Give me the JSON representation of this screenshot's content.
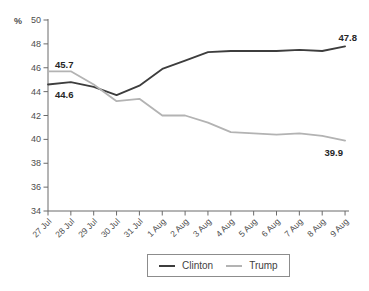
{
  "chart_data": {
    "type": "line",
    "title": "",
    "ylabel": "%",
    "categories": [
      "27 Jul",
      "28 Jul",
      "29 Jul",
      "30 Jul",
      "31 Jul",
      "1 Aug",
      "2 Aug",
      "3 Aug",
      "4 Aug",
      "5 Aug",
      "6 Aug",
      "7 Aug",
      "8 Aug",
      "9 Aug"
    ],
    "series": [
      {
        "name": "Clinton",
        "color": "#3d3d3d",
        "values": [
          44.6,
          44.8,
          44.4,
          43.7,
          44.5,
          45.9,
          46.6,
          47.3,
          47.4,
          47.4,
          47.4,
          47.5,
          47.4,
          47.8
        ]
      },
      {
        "name": "Trump",
        "color": "#b3b3b3",
        "values": [
          45.7,
          45.7,
          44.6,
          43.2,
          43.4,
          42.0,
          42.0,
          41.4,
          40.6,
          40.5,
          40.4,
          40.5,
          40.3,
          39.9
        ]
      }
    ],
    "ylim": [
      34,
      50
    ],
    "ytick_step": 2,
    "yticks": [
      "34",
      "36",
      "38",
      "40",
      "42",
      "44",
      "46",
      "48",
      "50"
    ],
    "grid": false,
    "legend_position": "bottom",
    "annotations": [
      {
        "series": "Clinton",
        "position": "start",
        "text": "44.6"
      },
      {
        "series": "Clinton",
        "position": "end",
        "text": "47.8"
      },
      {
        "series": "Trump",
        "position": "start",
        "text": "45.7"
      },
      {
        "series": "Trump",
        "position": "end",
        "text": "39.9"
      }
    ]
  },
  "legend": {
    "items": [
      {
        "label": "Clinton",
        "color": "#3d3d3d"
      },
      {
        "label": "Trump",
        "color": "#b3b3b3"
      }
    ]
  },
  "colors": {
    "background": "#ffffff",
    "axis": "#6b6b6b",
    "tick_label": "#4d4d4d",
    "data_label": "#262626",
    "legend_border": "#8c8c8c",
    "legend_text": "#3f3f3f"
  }
}
